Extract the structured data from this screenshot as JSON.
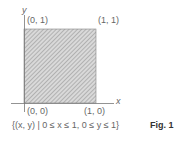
{
  "figure": {
    "axis_labels": {
      "x": "x",
      "y": "y"
    },
    "corners": [
      {
        "id": "top-left",
        "label": "(0, 1)"
      },
      {
        "id": "top-right",
        "label": "(1, 1)"
      },
      {
        "id": "bottom-left",
        "label": "(0, 0)"
      },
      {
        "id": "bottom-right",
        "label": "(1, 0)"
      }
    ],
    "region": "unit-square-shaded",
    "caption": "{(x, y) | 0 ≤ x ≤ 1, 0 ≤ y ≤ 1}",
    "figure_label": "Fig. 1",
    "colors": {
      "hatch": "#8a8a8a",
      "fill": "#d6d6d6",
      "axis": "#777777"
    }
  }
}
